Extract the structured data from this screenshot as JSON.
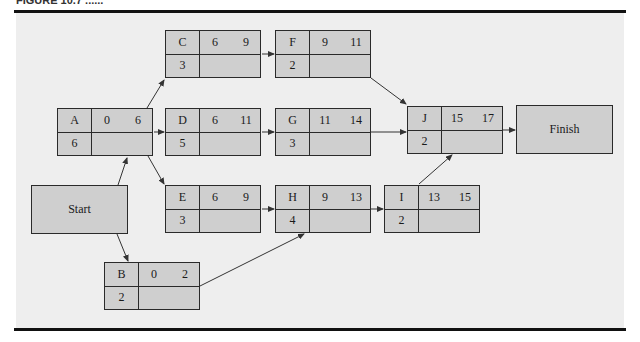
{
  "figure": {
    "caption_partial": "FIGURE 10.7 ......"
  },
  "diagram": {
    "type": "activity-on-node network",
    "terminals": {
      "start": {
        "label": "Start"
      },
      "finish": {
        "label": "Finish"
      }
    },
    "nodes": {
      "A": {
        "name": "A",
        "es": "0",
        "ef": "6",
        "duration": "6"
      },
      "B": {
        "name": "B",
        "es": "0",
        "ef": "2",
        "duration": "2"
      },
      "C": {
        "name": "C",
        "es": "6",
        "ef": "9",
        "duration": "3"
      },
      "D": {
        "name": "D",
        "es": "6",
        "ef": "11",
        "duration": "5"
      },
      "E": {
        "name": "E",
        "es": "6",
        "ef": "9",
        "duration": "3"
      },
      "F": {
        "name": "F",
        "es": "9",
        "ef": "11",
        "duration": "2"
      },
      "G": {
        "name": "G",
        "es": "11",
        "ef": "14",
        "duration": "3"
      },
      "H": {
        "name": "H",
        "es": "9",
        "ef": "13",
        "duration": "4"
      },
      "I": {
        "name": "I",
        "es": "13",
        "ef": "15",
        "duration": "2"
      },
      "J": {
        "name": "J",
        "es": "15",
        "ef": "17",
        "duration": "2"
      }
    },
    "edges": [
      [
        "Start",
        "A"
      ],
      [
        "Start",
        "B"
      ],
      [
        "A",
        "C"
      ],
      [
        "A",
        "D"
      ],
      [
        "A",
        "E"
      ],
      [
        "C",
        "F"
      ],
      [
        "D",
        "G"
      ],
      [
        "E",
        "H"
      ],
      [
        "B",
        "H"
      ],
      [
        "F",
        "J"
      ],
      [
        "G",
        "J"
      ],
      [
        "H",
        "I"
      ],
      [
        "I",
        "J"
      ],
      [
        "J",
        "Finish"
      ]
    ]
  }
}
